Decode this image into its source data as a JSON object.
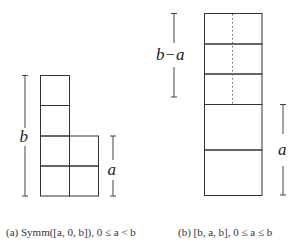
{
  "figure_a": {
    "caption": "(a) Symm([a, 0, b]), 0 ≤ a < b",
    "dimension_labels": {
      "tall": "b",
      "short": "a"
    },
    "grid": {
      "column_heights_in_cells": [
        4,
        2
      ],
      "cell_size_px": 30
    }
  },
  "figure_b": {
    "caption": "(b) [b, a, b], 0 ≤ a ≤ b",
    "dimension_labels": {
      "top": "b−a",
      "bottom": "a"
    },
    "column": {
      "rows": 5,
      "dotted_split_rows": 3
    }
  }
}
